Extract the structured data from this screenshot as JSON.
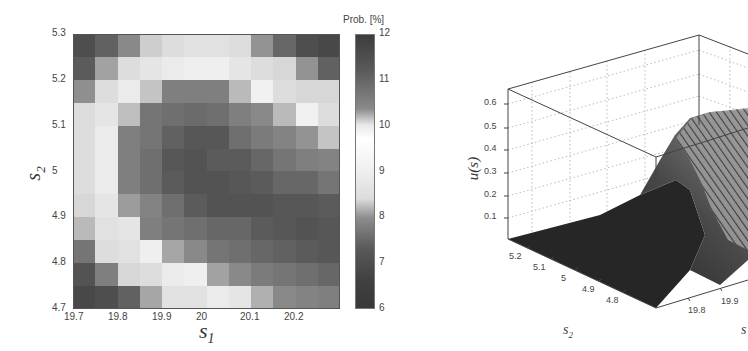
{
  "chart_data": [
    {
      "type": "heatmap",
      "title": "",
      "xlabel": "s1",
      "ylabel": "s2",
      "colorbar_label": "Prob. [%]",
      "colorbar_ticks": [
        "12",
        "11",
        "10",
        "9",
        "8",
        "7",
        "6"
      ],
      "colorbar_range": [
        6,
        12
      ],
      "colormap_note": "dark at both ends (6 and 12), light around 9-10",
      "x_ticks": [
        "19.7",
        "19.8",
        "19.9",
        "20",
        "20.1",
        "20.2"
      ],
      "y_ticks": [
        "5.3",
        "5.2",
        "5.1",
        "5",
        "4.9",
        "4.8",
        "4.7"
      ],
      "xlim": [
        19.7,
        20.3
      ],
      "ylim": [
        4.7,
        5.3
      ],
      "grid": "12x12",
      "row_order": "top (s2=5.3) to bottom (s2=4.7)",
      "shade": [
        [
          0.85,
          0.75,
          0.55,
          0.2,
          0.12,
          0.1,
          0.1,
          0.12,
          0.5,
          0.72,
          0.85,
          0.88
        ],
        [
          0.78,
          0.42,
          0.12,
          0.08,
          0.05,
          0.03,
          0.03,
          0.08,
          0.12,
          0.15,
          0.5,
          0.75
        ],
        [
          0.52,
          0.12,
          0.05,
          0.25,
          0.6,
          0.6,
          0.6,
          0.3,
          0.02,
          0.12,
          0.15,
          0.15
        ],
        [
          0.12,
          0.08,
          0.28,
          0.65,
          0.68,
          0.7,
          0.68,
          0.6,
          0.55,
          0.3,
          0.02,
          0.12
        ],
        [
          0.12,
          0.05,
          0.6,
          0.65,
          0.75,
          0.8,
          0.8,
          0.68,
          0.62,
          0.58,
          0.5,
          0.25
        ],
        [
          0.12,
          0.05,
          0.6,
          0.68,
          0.8,
          0.82,
          0.78,
          0.78,
          0.72,
          0.65,
          0.6,
          0.58
        ],
        [
          0.12,
          0.05,
          0.6,
          0.68,
          0.78,
          0.82,
          0.82,
          0.8,
          0.78,
          0.72,
          0.72,
          0.65
        ],
        [
          0.15,
          0.08,
          0.45,
          0.58,
          0.68,
          0.78,
          0.82,
          0.82,
          0.82,
          0.8,
          0.8,
          0.78
        ],
        [
          0.3,
          0.1,
          0.08,
          0.6,
          0.65,
          0.68,
          0.72,
          0.72,
          0.78,
          0.8,
          0.82,
          0.8
        ],
        [
          0.65,
          0.12,
          0.1,
          0.03,
          0.4,
          0.55,
          0.65,
          0.68,
          0.72,
          0.75,
          0.78,
          0.8
        ],
        [
          0.82,
          0.6,
          0.15,
          0.12,
          0.05,
          0.03,
          0.42,
          0.55,
          0.62,
          0.65,
          0.68,
          0.72
        ],
        [
          0.88,
          0.85,
          0.75,
          0.4,
          0.1,
          0.1,
          0.05,
          0.08,
          0.35,
          0.55,
          0.58,
          0.6
        ]
      ],
      "values_estimated": [
        [
          6.4,
          6.8,
          7.5,
          8.7,
          9.2,
          9.4,
          9.4,
          9.2,
          10.8,
          11.4,
          11.8,
          11.9
        ],
        [
          6.6,
          7.9,
          8.9,
          9.4,
          9.7,
          9.9,
          9.9,
          9.4,
          9.2,
          9.0,
          10.8,
          11.6
        ],
        [
          7.6,
          9.2,
          9.7,
          10.3,
          11.0,
          11.0,
          11.0,
          10.3,
          10.0,
          9.2,
          9.0,
          9.0
        ],
        [
          9.2,
          9.4,
          10.3,
          11.2,
          11.2,
          11.3,
          11.2,
          11.0,
          10.8,
          10.3,
          10.0,
          9.2
        ],
        [
          9.2,
          9.7,
          11.0,
          11.2,
          11.4,
          11.6,
          11.6,
          11.2,
          11.1,
          11.0,
          10.8,
          10.2
        ],
        [
          9.2,
          9.7,
          11.0,
          11.2,
          11.6,
          11.7,
          11.5,
          11.5,
          11.4,
          11.2,
          11.0,
          11.0
        ],
        [
          9.2,
          9.7,
          11.0,
          11.2,
          11.5,
          11.7,
          11.7,
          11.6,
          11.5,
          11.4,
          11.4,
          11.2
        ],
        [
          9.0,
          9.4,
          10.6,
          11.0,
          11.2,
          11.5,
          11.7,
          11.7,
          11.7,
          11.6,
          11.6,
          11.5
        ],
        [
          8.3,
          9.4,
          9.5,
          11.0,
          11.1,
          11.2,
          11.4,
          11.4,
          11.5,
          11.6,
          11.7,
          11.6
        ],
        [
          7.1,
          9.2,
          9.4,
          9.9,
          10.5,
          11.0,
          11.1,
          11.2,
          11.4,
          11.4,
          11.5,
          11.6
        ],
        [
          6.5,
          7.5,
          9.0,
          9.2,
          9.7,
          9.9,
          10.6,
          11.0,
          11.1,
          11.2,
          11.2,
          11.4
        ],
        [
          6.3,
          6.5,
          6.8,
          8.2,
          9.4,
          9.4,
          9.7,
          9.5,
          10.5,
          11.0,
          11.0,
          11.0
        ]
      ]
    },
    {
      "type": "surface3d",
      "title": "",
      "xlabel": "s1",
      "ylabel": "s2",
      "zlabel": "u(s)",
      "z_ticks": [
        "0.1",
        "0.2",
        "0.3",
        "0.4",
        "0.5",
        "0.6"
      ],
      "s2_ticks": [
        "5.2",
        "5.1",
        "5",
        "4.9",
        "4.8"
      ],
      "s1_ticks_visible": [
        "19.8",
        "19.9"
      ],
      "zlim": [
        0,
        0.65
      ],
      "grid": "dotted",
      "description": "Surface near 0 for s1 < ~19.9 (dark flat region), rising steeply around s1 ~19.95-20.05 to a plateau ~0.55-0.6 for larger s1; little dependence on s2"
    }
  ],
  "labels": {
    "heat_xlabel": "s",
    "heat_xlabel_sub": "1",
    "heat_ylabel": "s",
    "heat_ylabel_sub": "2",
    "prob_label": "Prob. [%]",
    "surf_zlabel": "u(s)",
    "surf_s2": "s",
    "surf_s2_sub": "2",
    "surf_s1": "s"
  }
}
